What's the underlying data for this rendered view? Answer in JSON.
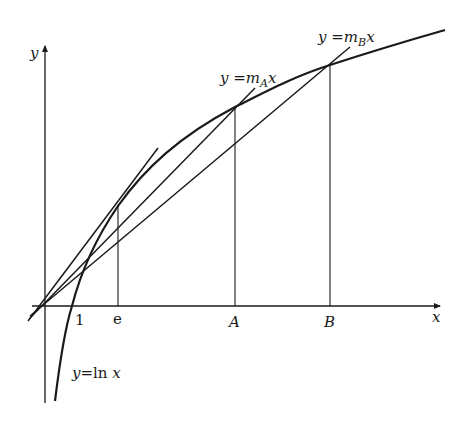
{
  "diagram": {
    "axes": {
      "x_label": "x",
      "y_label": "y"
    },
    "ticks": {
      "one": "1",
      "e": "e",
      "A": "A",
      "B": "B"
    },
    "curve": {
      "label_y": "y",
      "label_eq": "=",
      "label_fn": "ln",
      "label_x": "x",
      "function": "y = ln x"
    },
    "lines": {
      "mA": {
        "y": "y",
        "eq": " =",
        "m": "m",
        "sub": "A",
        "x": "x"
      },
      "mB": {
        "y": "y",
        "eq": " =",
        "m": "m",
        "sub": "B",
        "x": "x"
      }
    },
    "colors": {
      "ink": "#1a1a1a",
      "background": "#ffffff"
    }
  }
}
